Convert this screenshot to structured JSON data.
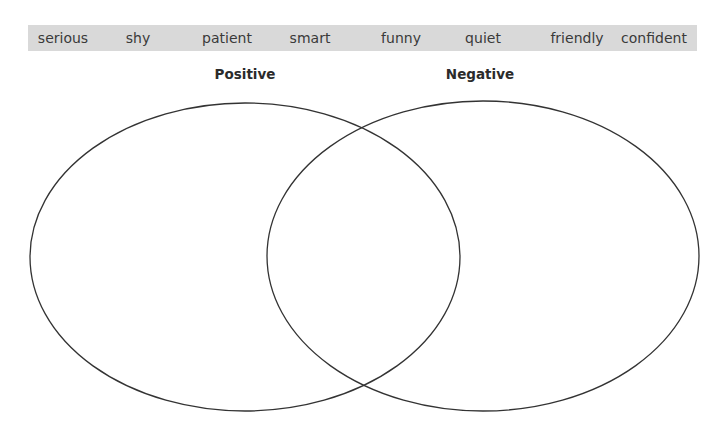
{
  "word_bank": {
    "background": "#d9d9d9",
    "words": [
      {
        "label": "serious",
        "x": 63
      },
      {
        "label": "shy",
        "x": 138
      },
      {
        "label": "patient",
        "x": 227
      },
      {
        "label": "smart",
        "x": 310
      },
      {
        "label": "funny",
        "x": 401
      },
      {
        "label": "quiet",
        "x": 483
      },
      {
        "label": "friendly",
        "x": 577
      },
      {
        "label": "confident",
        "x": 654
      }
    ]
  },
  "venn": {
    "stroke": "#333333",
    "circles": [
      {
        "label": "Positive",
        "label_x": 245,
        "cx": 245,
        "cy": 257,
        "rx": 215,
        "ry": 154
      },
      {
        "label": "Negative",
        "label_x": 480,
        "cx": 483,
        "cy": 256,
        "rx": 216,
        "ry": 155
      }
    ]
  }
}
